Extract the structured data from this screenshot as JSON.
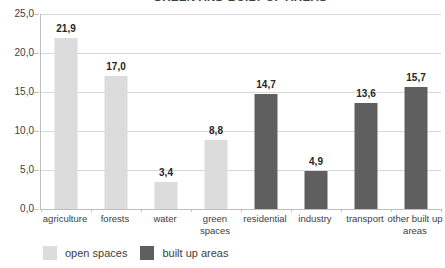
{
  "chart_data": {
    "type": "bar",
    "title": "GREEN AND BUILT UP AREAS",
    "categories": [
      "agriculture",
      "forests",
      "water",
      "green spaces",
      "residential",
      "industry",
      "transport",
      "other built up areas"
    ],
    "values": [
      21.9,
      17.0,
      3.4,
      8.8,
      14.7,
      4.9,
      13.6,
      15.7
    ],
    "value_labels": [
      "21,9",
      "17,0",
      "3,4",
      "8,8",
      "14,7",
      "4,9",
      "13,6",
      "15,7"
    ],
    "groups": [
      "open",
      "open",
      "open",
      "open",
      "built",
      "built",
      "built",
      "built"
    ],
    "group_colors": {
      "open": "#dcdcdc",
      "built": "#5f5f5f"
    },
    "xlabel": "",
    "ylabel": "",
    "ylim": [
      0,
      25
    ],
    "y_ticks": [
      "25,0",
      "20,0",
      "15,0",
      "10,0",
      "5,0",
      "0,0"
    ],
    "y_tick_values": [
      25,
      20,
      15,
      10,
      5,
      0
    ],
    "grid": true,
    "number_format": "decimal-comma",
    "legend_position": "bottom-left",
    "legend": [
      {
        "label": "open spaces",
        "color": "#dcdcdc"
      },
      {
        "label": "built up areas",
        "color": "#5f5f5f"
      }
    ],
    "style_colors": {
      "gridline": "#d9d9d9",
      "axis": "#bfbfbf",
      "axis_text": "#404040",
      "value_text": "#262626",
      "background": "#ffffff"
    }
  }
}
